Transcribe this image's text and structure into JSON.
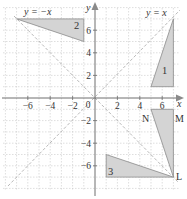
{
  "diagram": {
    "type": "coordinate-grid-transformations",
    "axes": {
      "x_label": "x",
      "y_label": "y",
      "x_ticks": [
        {
          "value": -6,
          "label": "−6"
        },
        {
          "value": -4,
          "label": "−4"
        },
        {
          "value": -2,
          "label": "−2"
        },
        {
          "value": 2,
          "label": "2"
        },
        {
          "value": 4,
          "label": "4"
        },
        {
          "value": 6,
          "label": "6"
        }
      ],
      "y_ticks": [
        {
          "value": 6,
          "label": "6"
        },
        {
          "value": 4,
          "label": "4"
        },
        {
          "value": 2,
          "label": "2"
        },
        {
          "value": -2,
          "label": "−2"
        },
        {
          "value": -4,
          "label": "−4"
        },
        {
          "value": -6,
          "label": "−6"
        }
      ],
      "origin_label": "0",
      "range": [
        -8,
        8
      ]
    },
    "lines": [
      {
        "name": "y = x",
        "label": "y = x"
      },
      {
        "name": "y = -x",
        "label": "y = −x"
      }
    ],
    "shapes": [
      {
        "id": "1",
        "label": "1",
        "vertices": [
          [
            5,
            1
          ],
          [
            7,
            1
          ],
          [
            7,
            7
          ]
        ]
      },
      {
        "id": "2",
        "label": "2",
        "vertices": [
          [
            -7,
            7
          ],
          [
            -1,
            7
          ],
          [
            -1,
            5
          ]
        ]
      },
      {
        "id": "3",
        "label": "3",
        "vertices": [
          [
            1,
            -5
          ],
          [
            1,
            -7
          ],
          [
            7,
            -7
          ]
        ]
      },
      {
        "id": "LMN",
        "label": "",
        "vertices": [
          [
            7,
            -7
          ],
          [
            7,
            -1
          ],
          [
            5,
            -1
          ]
        ],
        "vertex_labels": {
          "L": "L",
          "M": "M",
          "N": "N"
        }
      }
    ],
    "colors": {
      "shape_fill": "#d4d4d4",
      "shape_stroke": "#8a8a8a",
      "grid": "#c8c8c8",
      "axis": "#6e6e6e",
      "diagonal": "#b0b0b0"
    }
  }
}
